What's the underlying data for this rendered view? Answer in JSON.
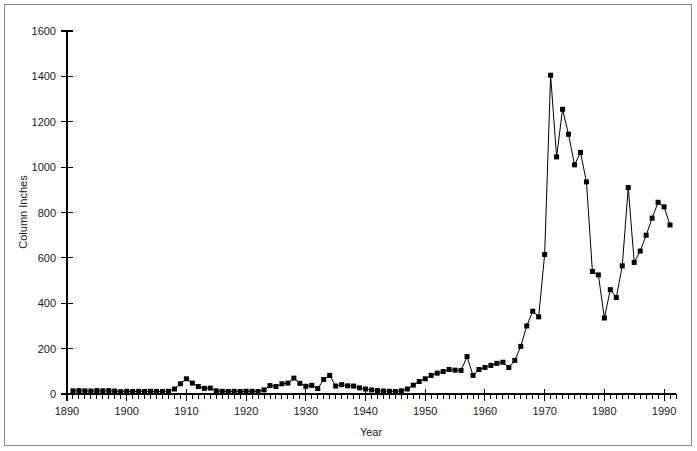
{
  "figure": {
    "background_color": "#ffffff",
    "frame_color": "#8a8a8a",
    "series_color": "#000000"
  },
  "chart_data": {
    "type": "line",
    "title": "",
    "subtitle": "",
    "xlabel": "Year",
    "ylabel": "Column Inches",
    "xlim": [
      1890,
      1992
    ],
    "ylim": [
      0,
      1600
    ],
    "grid": false,
    "legend": null,
    "legend_position": "none",
    "marker": "square",
    "x_major_ticks": [
      1890,
      1900,
      1910,
      1920,
      1930,
      1940,
      1950,
      1960,
      1970,
      1980,
      1990
    ],
    "x_major_tick_labels": [
      "1890",
      "1900",
      "1910",
      "1920",
      "1930",
      "1940",
      "1950",
      "1960",
      "1970",
      "1980",
      "1990"
    ],
    "x_minor_tick_interval": 1,
    "y_major_ticks": [
      0,
      200,
      400,
      600,
      800,
      1000,
      1200,
      1400,
      1600
    ],
    "y_major_tick_labels": [
      "0",
      "200",
      "400",
      "600",
      "800",
      "1000",
      "1200",
      "1400",
      "1600"
    ],
    "annotations": [],
    "series": [
      {
        "name": "Column Inches",
        "x": [
          1891,
          1892,
          1893,
          1894,
          1895,
          1896,
          1897,
          1898,
          1899,
          1900,
          1901,
          1902,
          1903,
          1904,
          1905,
          1906,
          1907,
          1908,
          1909,
          1910,
          1911,
          1912,
          1913,
          1914,
          1915,
          1916,
          1917,
          1918,
          1919,
          1920,
          1921,
          1922,
          1923,
          1924,
          1925,
          1926,
          1927,
          1928,
          1929,
          1930,
          1931,
          1932,
          1933,
          1934,
          1935,
          1936,
          1937,
          1938,
          1939,
          1940,
          1941,
          1942,
          1943,
          1944,
          1945,
          1946,
          1947,
          1948,
          1949,
          1950,
          1951,
          1952,
          1953,
          1954,
          1955,
          1956,
          1957,
          1958,
          1959,
          1960,
          1961,
          1962,
          1963,
          1964,
          1965,
          1966,
          1967,
          1968,
          1969,
          1970,
          1971,
          1972,
          1973,
          1974,
          1975,
          1976,
          1977,
          1978,
          1979,
          1980,
          1981,
          1982,
          1983,
          1984,
          1985,
          1986,
          1987,
          1988,
          1989,
          1990,
          1991
        ],
        "values": [
          14,
          15,
          14,
          13,
          15,
          14,
          15,
          13,
          10,
          12,
          11,
          12,
          11,
          12,
          11,
          11,
          12,
          22,
          45,
          67,
          48,
          33,
          25,
          26,
          14,
          12,
          11,
          12,
          11,
          12,
          12,
          11,
          18,
          37,
          33,
          45,
          48,
          70,
          47,
          34,
          38,
          24,
          64,
          82,
          35,
          41,
          36,
          35,
          27,
          22,
          18,
          15,
          13,
          12,
          11,
          14,
          22,
          39,
          55,
          67,
          82,
          92,
          99,
          108,
          105,
          104,
          165,
          82,
          108,
          117,
          126,
          135,
          140,
          117,
          148,
          210,
          300,
          365,
          340,
          615,
          1405,
          1045,
          1255,
          1145,
          1010,
          1065,
          935,
          540,
          525,
          335,
          460,
          425,
          565,
          910,
          580,
          630,
          700,
          775,
          845,
          825,
          745
        ]
      }
    ]
  },
  "axis_titles": {
    "y": "Column Inches",
    "x": "Year"
  }
}
